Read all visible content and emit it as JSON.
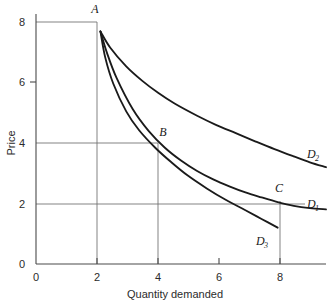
{
  "chart_data": {
    "type": "line",
    "title": "",
    "xlabel": "Quantity demanded",
    "ylabel": "Price",
    "xlim": [
      0,
      9
    ],
    "ylim": [
      0,
      8.6
    ],
    "grid": false,
    "legend_position": "curve-end labels",
    "x_ticks": [
      "0",
      "2",
      "4",
      "6",
      "8"
    ],
    "x_tick_values": [
      0,
      2,
      4,
      6,
      8
    ],
    "y_ticks": [
      "0",
      "2",
      "4",
      "6",
      "8"
    ],
    "y_tick_values": [
      0,
      2,
      4,
      6,
      8
    ],
    "series": [
      {
        "name": "D1",
        "label": "D",
        "subscript": "1",
        "description": "Unit-elastic demand curve through A, B and C (P x Q = 16)",
        "points": [
          [
            2,
            8
          ],
          [
            2.2,
            7.27
          ],
          [
            2.5,
            6.4
          ],
          [
            3,
            5.33
          ],
          [
            3.5,
            4.57
          ],
          [
            4,
            4
          ],
          [
            4.5,
            3.56
          ],
          [
            5,
            3.2
          ],
          [
            5.5,
            2.91
          ],
          [
            6,
            2.67
          ],
          [
            6.5,
            2.46
          ],
          [
            7,
            2.29
          ],
          [
            7.5,
            2.13
          ],
          [
            8,
            2
          ],
          [
            8.5,
            1.92
          ],
          [
            9,
            1.88
          ]
        ]
      },
      {
        "name": "D2",
        "label": "D",
        "subscript": "2",
        "description": "Flatter, more elastic demand curve from A",
        "points": [
          [
            2,
            8
          ],
          [
            2.3,
            7.45
          ],
          [
            2.8,
            6.8
          ],
          [
            3.3,
            6.3
          ],
          [
            3.8,
            5.88
          ],
          [
            4.3,
            5.52
          ],
          [
            5,
            5.1
          ],
          [
            5.6,
            4.78
          ],
          [
            6.2,
            4.5
          ],
          [
            6.8,
            4.22
          ],
          [
            7.4,
            3.95
          ],
          [
            8,
            3.7
          ],
          [
            8.5,
            3.5
          ],
          [
            9,
            3.33
          ]
        ]
      },
      {
        "name": "D3",
        "label": "D",
        "subscript": "3",
        "description": "Steeper, less elastic demand curve from A",
        "points": [
          [
            2,
            8
          ],
          [
            2.15,
            7.1
          ],
          [
            2.4,
            6.2
          ],
          [
            2.8,
            5.25
          ],
          [
            3.2,
            4.6
          ],
          [
            3.7,
            4.0
          ],
          [
            4.2,
            3.5
          ],
          [
            4.7,
            3.05
          ],
          [
            5.3,
            2.6
          ],
          [
            5.9,
            2.2
          ],
          [
            6.5,
            1.85
          ],
          [
            7.0,
            1.55
          ],
          [
            7.5,
            1.25
          ]
        ]
      }
    ],
    "points_of_interest": [
      {
        "label": "A",
        "x": 2,
        "y": 8
      },
      {
        "label": "B",
        "x": 4,
        "y": 4
      },
      {
        "label": "C",
        "x": 8,
        "y": 2
      }
    ],
    "reference_lines": {
      "horizontal_y": [
        8,
        4,
        2
      ],
      "vertical_x": [
        2,
        4,
        8
      ]
    }
  }
}
